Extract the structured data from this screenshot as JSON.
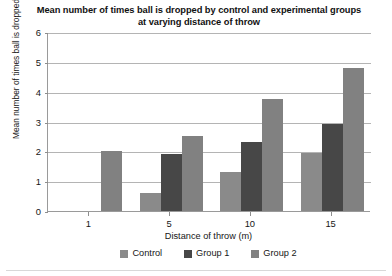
{
  "chart_data": {
    "type": "bar",
    "title": "Mean number of times ball is dropped by control and experimental groups at varying distance of throw",
    "xlabel": "Distance of throw (m)",
    "ylabel": "Mean number of times ball is dropped",
    "categories": [
      "1",
      "5",
      "10",
      "15"
    ],
    "series": [
      {
        "name": "Control",
        "color": "#8a8a8a",
        "values": [
          0,
          0.6,
          1.3,
          1.95
        ]
      },
      {
        "name": "Group 1",
        "color": "#474747",
        "values": [
          0,
          1.9,
          2.3,
          2.9
        ]
      },
      {
        "name": "Group 2",
        "color": "#818181",
        "values": [
          2.0,
          2.5,
          3.75,
          4.8
        ]
      }
    ],
    "ylim": [
      0,
      6
    ],
    "y_ticks": [
      "0",
      "1",
      "2",
      "3",
      "4",
      "5",
      "6"
    ],
    "grid": true,
    "legend_position": "bottom"
  }
}
